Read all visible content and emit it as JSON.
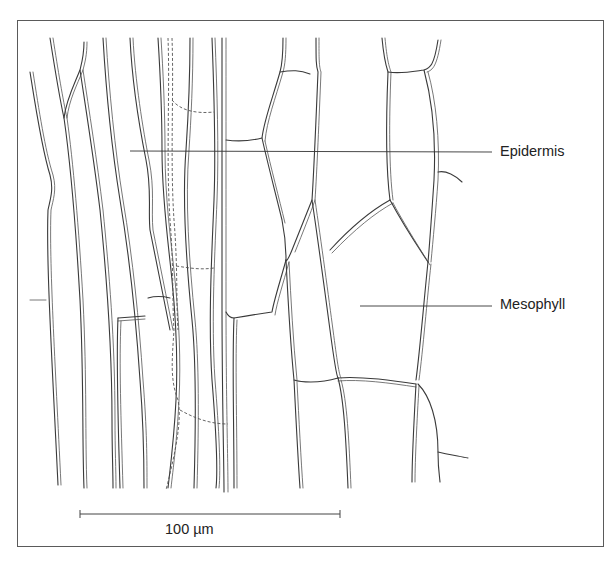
{
  "figure": {
    "type": "botanical line drawing",
    "labels": [
      {
        "id": "epidermis",
        "text": "Epidermis"
      },
      {
        "id": "mesophyll",
        "text": "Mesophyll"
      }
    ],
    "scale_bar": {
      "label": "100 µm",
      "value": 100,
      "unit": "µm"
    },
    "colors": {
      "line": "#3a3a3a",
      "frame": "#5a5a5a",
      "background": "#ffffff"
    }
  }
}
